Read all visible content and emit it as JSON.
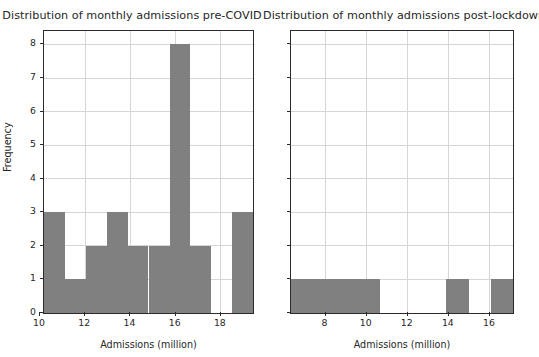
{
  "figure": {
    "width": 539,
    "height": 357,
    "background": "#ffffff",
    "bar_color": "#808080",
    "grid_color": "#d6d6d6",
    "axis_color": "#2b2b2b",
    "text_color": "#262626"
  },
  "chart_data": [
    {
      "type": "bar",
      "subplot": "left",
      "title": "Distribution of monthly admissions pre-COVID",
      "xlabel": "Admissions (million)",
      "ylabel": "Frequency",
      "grid": true,
      "legend": null,
      "xlim": [
        10.18,
        19.42
      ],
      "ylim": [
        0,
        8.4
      ],
      "xticks": [
        10,
        12,
        14,
        16,
        18
      ],
      "xtick_labels": [
        "10",
        "12",
        "14",
        "16",
        "18"
      ],
      "yticks": [
        0,
        1,
        2,
        3,
        4,
        5,
        6,
        7,
        8
      ],
      "ytick_labels": [
        "0",
        "1",
        "2",
        "3",
        "4",
        "5",
        "6",
        "7",
        "8"
      ],
      "bin_edges": [
        10.18,
        11.1,
        12.03,
        12.95,
        13.88,
        14.8,
        15.73,
        16.65,
        17.57,
        18.5,
        19.42
      ],
      "categories": [
        "10.18-11.10",
        "11.10-12.03",
        "12.03-12.95",
        "12.95-13.88",
        "13.88-14.80",
        "14.80-15.73",
        "15.73-16.65",
        "16.65-17.57",
        "17.57-18.50",
        "18.50-19.42"
      ],
      "values": [
        3,
        1,
        2,
        3,
        2,
        2,
        8,
        2,
        0,
        3
      ]
    },
    {
      "type": "bar",
      "subplot": "right",
      "title": "Distribution of monthly admissions post-lockdown",
      "xlabel": "Admissions (million)",
      "ylabel": "Frequency",
      "grid": true,
      "legend": null,
      "xlim": [
        6.32,
        17.12
      ],
      "ylim": [
        0,
        8.4
      ],
      "xticks": [
        8,
        10,
        12,
        14,
        16
      ],
      "xtick_labels": [
        "8",
        "10",
        "12",
        "14",
        "16"
      ],
      "yticks": [
        0,
        1,
        2,
        3,
        4,
        5,
        6,
        7,
        8
      ],
      "ytick_labels": [],
      "bin_edges": [
        6.32,
        7.4,
        8.48,
        9.56,
        10.64,
        11.72,
        12.8,
        13.88,
        14.96,
        16.04,
        17.12
      ],
      "categories": [
        "6.32-7.40",
        "7.40-8.48",
        "8.48-9.56",
        "9.56-10.64",
        "10.64-11.72",
        "11.72-12.80",
        "12.80-13.88",
        "13.88-14.96",
        "14.96-16.04",
        "16.04-17.12"
      ],
      "values": [
        1,
        1,
        1,
        1,
        0,
        0,
        0,
        1,
        0,
        1
      ]
    }
  ]
}
